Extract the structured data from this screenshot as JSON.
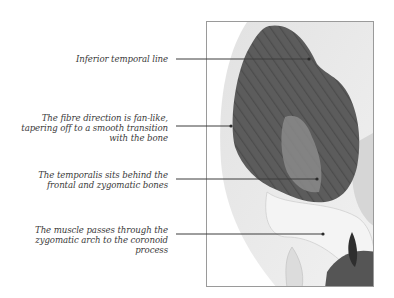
{
  "diagram": {
    "colors": {
      "muscle": "#5c5c5c",
      "muscle_dark": "#444444",
      "tendon": "#8a8a8a",
      "bone": "#ececec",
      "bone_shadow": "#cfcfcf",
      "leader_line": "#3c3c3c",
      "frame_border": "#9a9a9a",
      "label_text": "#3a3a3a"
    },
    "annotations": [
      {
        "text": "Inferior temporal line"
      },
      {
        "text": "The fibre direction is fan-like,\ntapering off to a smooth transition\nwith the bone"
      },
      {
        "text": "The temporalis sits behind the\nfrontal and zygomatic bones"
      },
      {
        "text": "The muscle passes through the\nzygomatic arch to the coronoid\nprocess"
      }
    ]
  }
}
